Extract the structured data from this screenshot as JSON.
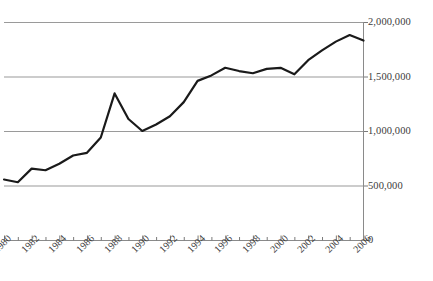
{
  "chart_data": {
    "type": "line",
    "title": "",
    "subtitle": "",
    "xlabel": "",
    "ylabel": "",
    "xlim": [
      1980,
      2006
    ],
    "ylim": [
      0,
      2000000
    ],
    "grid": true,
    "legend": false,
    "legend_position": "none",
    "y_axis_side": "right",
    "y_ticks": [
      2000000,
      1500000,
      1000000,
      500000,
      0
    ],
    "y_tick_labels": [
      "2,000,000",
      "1,500,000",
      "1,000,000",
      "500,000",
      "0"
    ],
    "x_tick_labels": [
      "1980",
      "1982",
      "1984",
      "1986",
      "1988",
      "1990",
      "1992",
      "1994",
      "1996",
      "1998",
      "2000",
      "2002",
      "2004",
      "2006"
    ],
    "x_tick_label_rotation": -45,
    "x_tick_label_interval": 2,
    "x_minor_ticks_every": 1,
    "series": [
      {
        "name": "series-1",
        "color": "#1a1a1a",
        "line_width": 2.2,
        "x": [
          1980,
          1981,
          1982,
          1983,
          1984,
          1985,
          1986,
          1987,
          1988,
          1989,
          1990,
          1991,
          1992,
          1993,
          1994,
          1995,
          1996,
          1997,
          1998,
          1999,
          2000,
          2001,
          2002,
          2003,
          2004,
          2005,
          2006
        ],
        "values": [
          555000,
          530000,
          655000,
          640000,
          700000,
          775000,
          800000,
          940000,
          1345000,
          1110000,
          1000000,
          1060000,
          1135000,
          1265000,
          1460000,
          1510000,
          1580000,
          1550000,
          1530000,
          1570000,
          1580000,
          1520000,
          1650000,
          1740000,
          1820000,
          1880000,
          1830000
        ]
      }
    ]
  },
  "axes": {
    "grid_color": "#9a9a9a",
    "axis_color": "#8a8a8a",
    "tick_color": "#7a7a7a",
    "label_color": "#3c3c3c",
    "background": "#ffffff"
  }
}
